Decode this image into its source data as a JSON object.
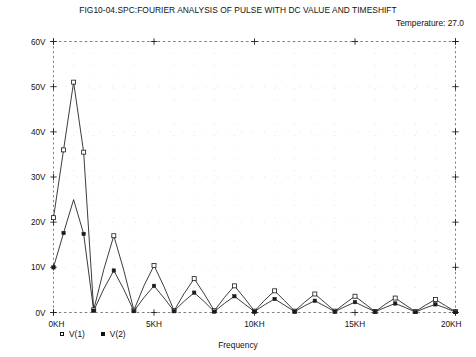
{
  "header": {
    "title": "FIG10-04.SPC:FOURIER ANALYSIS OF PULSE WITH DC VALUE AND TIMESHIFT",
    "temperature_label": "Temperature:  27.0"
  },
  "axes": {
    "x_title": "Frequency",
    "x_ticks": [
      "0KH",
      "5KH",
      "10KH",
      "15KH",
      "20KH"
    ],
    "y_ticks": [
      "0V",
      "10V",
      "20V",
      "30V",
      "40V",
      "50V",
      "60V"
    ]
  },
  "legend": {
    "items": [
      {
        "label": "V(1)",
        "marker": "open-square"
      },
      {
        "label": "V(2)",
        "marker": "filled-square"
      }
    ]
  },
  "colors": {
    "trace": "#1a1a1a",
    "grid": "#8d8d8d",
    "border": "#5a5a5a",
    "background": "#ffffff"
  },
  "chart_data": {
    "type": "line",
    "title": "FIG10-04.SPC:FOURIER ANALYSIS OF PULSE WITH DC VALUE AND TIMESHIFT",
    "subtitle": "Temperature:  27.0",
    "xlabel": "Frequency",
    "ylabel": "",
    "xlim": [
      0,
      20000
    ],
    "ylim": [
      0,
      60
    ],
    "x_tick_values": [
      0,
      5000,
      10000,
      15000,
      20000
    ],
    "x_tick_labels": [
      "0KH",
      "5KH",
      "10KH",
      "15KH",
      "20KH"
    ],
    "y_tick_values": [
      0,
      10,
      20,
      30,
      40,
      50,
      60
    ],
    "y_tick_labels": [
      "0V",
      "10V",
      "20V",
      "30V",
      "40V",
      "50V",
      "60V"
    ],
    "x_units": "Hz",
    "y_units": "V",
    "grid": true,
    "grid_style": "dotted",
    "legend_position": "below-axis-left",
    "series": [
      {
        "name": "V(1)",
        "marker": "open-square",
        "x": [
          0,
          500,
          1000,
          1500,
          2000,
          2500,
          3000,
          3500,
          4000,
          4500,
          5000,
          5500,
          6000,
          6500,
          7000,
          7500,
          8000,
          8500,
          9000,
          9500,
          10000,
          10500,
          11000,
          11500,
          12000,
          12500,
          13000,
          13500,
          14000,
          14500,
          15000,
          15500,
          16000,
          16500,
          17000,
          17500,
          18000,
          18500,
          19000,
          19500,
          20000
        ],
        "values": [
          21.0,
          36.0,
          51.0,
          35.5,
          0.6,
          9.5,
          17.0,
          9.3,
          0.5,
          5.9,
          10.4,
          5.7,
          0.4,
          4.2,
          7.5,
          4.1,
          0.4,
          3.3,
          5.9,
          3.2,
          0.3,
          2.7,
          4.8,
          2.6,
          0.3,
          2.3,
          4.1,
          2.2,
          0.3,
          2.0,
          3.6,
          1.9,
          0.2,
          1.8,
          3.2,
          1.7,
          0.2,
          1.6,
          2.9,
          1.5,
          0.2
        ]
      },
      {
        "name": "V(2)",
        "marker": "filled-square",
        "x": [
          0,
          500,
          1000,
          1500,
          2000,
          2500,
          3000,
          3500,
          4000,
          4500,
          5000,
          5500,
          6000,
          6500,
          7000,
          7500,
          8000,
          8500,
          9000,
          9500,
          10000,
          10500,
          11000,
          11500,
          12000,
          12500,
          13000,
          13500,
          14000,
          14500,
          15000,
          15500,
          16000,
          16500,
          17000,
          17500,
          18000,
          18500,
          19000,
          19500,
          20000
        ],
        "values": [
          10.0,
          17.6,
          25.0,
          17.4,
          0.4,
          5.2,
          9.3,
          5.1,
          0.3,
          3.3,
          5.9,
          3.2,
          0.3,
          2.5,
          4.4,
          2.4,
          0.2,
          2.0,
          3.6,
          1.9,
          0.2,
          1.7,
          3.0,
          1.6,
          0.2,
          1.5,
          2.6,
          1.4,
          0.2,
          1.3,
          2.3,
          1.2,
          0.2,
          1.1,
          2.0,
          1.1,
          0.1,
          1.0,
          1.8,
          1.0,
          0.1
        ]
      }
    ],
    "marked_points": {
      "V(1)": [
        {
          "x": 0,
          "y": 21.0
        },
        {
          "x": 500,
          "y": 36.0
        },
        {
          "x": 1000,
          "y": 51.0
        },
        {
          "x": 1500,
          "y": 35.5
        },
        {
          "x": 2000,
          "y": 0.6
        },
        {
          "x": 3000,
          "y": 17.0
        },
        {
          "x": 4000,
          "y": 0.5
        },
        {
          "x": 5000,
          "y": 10.4
        },
        {
          "x": 6000,
          "y": 0.4
        },
        {
          "x": 7000,
          "y": 7.5
        },
        {
          "x": 8000,
          "y": 0.4
        },
        {
          "x": 9000,
          "y": 5.9
        },
        {
          "x": 10000,
          "y": 0.3
        },
        {
          "x": 11000,
          "y": 4.8
        },
        {
          "x": 12000,
          "y": 0.3
        },
        {
          "x": 13000,
          "y": 4.1
        },
        {
          "x": 14000,
          "y": 0.3
        },
        {
          "x": 15000,
          "y": 3.6
        },
        {
          "x": 16000,
          "y": 0.2
        },
        {
          "x": 17000,
          "y": 3.2
        },
        {
          "x": 18000,
          "y": 0.2
        },
        {
          "x": 19000,
          "y": 2.9
        },
        {
          "x": 20000,
          "y": 0.2
        }
      ],
      "V(2)": [
        {
          "x": 0,
          "y": 10.0
        },
        {
          "x": 500,
          "y": 17.6
        },
        {
          "x": 1500,
          "y": 17.4
        },
        {
          "x": 2000,
          "y": 0.4
        },
        {
          "x": 3000,
          "y": 9.3
        },
        {
          "x": 4000,
          "y": 0.3
        },
        {
          "x": 5000,
          "y": 5.9
        },
        {
          "x": 6000,
          "y": 0.3
        },
        {
          "x": 7000,
          "y": 4.4
        },
        {
          "x": 8000,
          "y": 0.2
        },
        {
          "x": 9000,
          "y": 3.6
        },
        {
          "x": 10000,
          "y": 0.2
        },
        {
          "x": 11000,
          "y": 3.0
        },
        {
          "x": 12000,
          "y": 0.2
        },
        {
          "x": 13000,
          "y": 2.6
        },
        {
          "x": 14000,
          "y": 0.2
        },
        {
          "x": 15000,
          "y": 2.3
        },
        {
          "x": 16000,
          "y": 0.2
        },
        {
          "x": 17000,
          "y": 2.0
        },
        {
          "x": 18000,
          "y": 0.1
        },
        {
          "x": 19000,
          "y": 1.8
        },
        {
          "x": 20000,
          "y": 0.1
        }
      ]
    }
  }
}
